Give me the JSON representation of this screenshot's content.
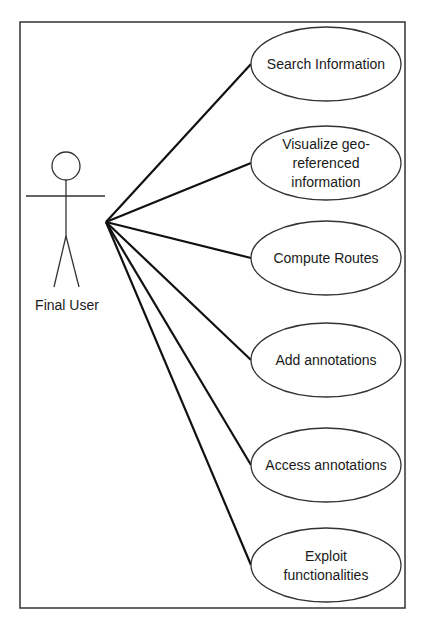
{
  "diagram": {
    "type": "uml-use-case",
    "actor": {
      "name": "Final User"
    },
    "use_cases": [
      {
        "id": "search",
        "lines": [
          "Search Information"
        ]
      },
      {
        "id": "visualize",
        "lines": [
          "Visualize geo-",
          "referenced",
          "information"
        ]
      },
      {
        "id": "routes",
        "lines": [
          "Compute Routes"
        ]
      },
      {
        "id": "add-annotations",
        "lines": [
          "Add annotations"
        ]
      },
      {
        "id": "access-annotations",
        "lines": [
          "Access annotations"
        ]
      },
      {
        "id": "exploit",
        "lines": [
          "Exploit",
          "functionalities"
        ]
      }
    ],
    "associations": [
      {
        "from": "Final User",
        "to": "search"
      },
      {
        "from": "Final User",
        "to": "visualize"
      },
      {
        "from": "Final User",
        "to": "routes"
      },
      {
        "from": "Final User",
        "to": "add-annotations"
      },
      {
        "from": "Final User",
        "to": "access-annotations"
      },
      {
        "from": "Final User",
        "to": "exploit"
      }
    ]
  }
}
